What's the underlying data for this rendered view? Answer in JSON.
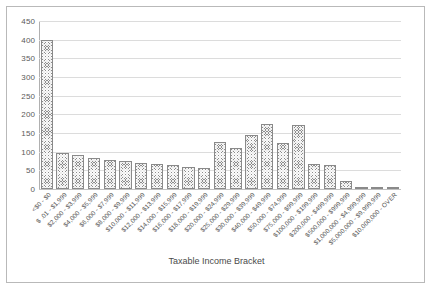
{
  "chart_data": {
    "type": "bar",
    "title": "",
    "xlabel": "Taxable Income Bracket",
    "ylabel": "",
    "ylim": [
      0,
      450
    ],
    "yticks": [
      450,
      400,
      350,
      300,
      250,
      200,
      150,
      100,
      50,
      0
    ],
    "grid": true,
    "legend": false,
    "bar_fill": "#8c8c8c",
    "bar_pattern": "cross-hatch",
    "categories": [
      "<$0 - $0",
      "$ .01 - $1,999",
      "$2,000 - $3,999",
      "$4,000 - $5,999",
      "$6,000 - $7,999",
      "$8,000 - $9,999",
      "$10,000 - $11,999",
      "$12,000 - $13,999",
      "$14,000 - $15,999",
      "$16,000 - $17,999",
      "$18,000 - $19,999",
      "$20,000 - $24,999",
      "$25,000 - $29,999",
      "$30,000 - $39,999",
      "$40,000 - $49,999",
      "$50,000 - $74,999",
      "$75,000 - $99,999",
      "$100,000 - $199,999",
      "$200,000 - $499,999",
      "$500,000 - $999,999",
      "$1,000,000 - $4,999,999",
      "$5,000,000 - $9,999,999",
      "$10,000,000 - OVER"
    ],
    "values": [
      400,
      96,
      90,
      82,
      78,
      76,
      70,
      67,
      63,
      60,
      57,
      125,
      110,
      145,
      175,
      122,
      172,
      68,
      63,
      22,
      6,
      2,
      1
    ]
  }
}
